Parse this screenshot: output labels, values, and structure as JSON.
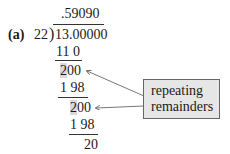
{
  "division": {
    "label": "(a)",
    "divisor": "22",
    "dividend": "13.00000",
    "quotient": ".59090",
    "steps": [
      {
        "value": "11 0"
      },
      {
        "highlight": "2",
        "rest": "00"
      },
      {
        "value": "1 98"
      },
      {
        "highlight": "2",
        "rest": "00"
      },
      {
        "value": "1 98"
      },
      {
        "value": "20"
      }
    ]
  },
  "callout": {
    "line1": "repeating",
    "line2": "remainders"
  },
  "colors": {
    "highlight": "#d9d9d9",
    "callout_bg": "#e6e6e6",
    "arrow": "#555555"
  }
}
